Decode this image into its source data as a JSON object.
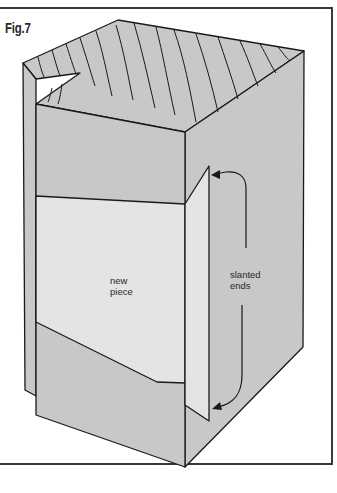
{
  "figure": {
    "title": "Fig.7",
    "labels": {
      "new_piece_line1": "new",
      "new_piece_line2": "piece",
      "slanted_line1": "slanted",
      "slanted_line2": "ends"
    },
    "colors": {
      "outline": "#1a1a1a",
      "box_fill": "#c8c8c8",
      "new_piece_fill": "#e4e4e4",
      "frame": "#3a3a3a",
      "background": "#ffffff"
    }
  }
}
